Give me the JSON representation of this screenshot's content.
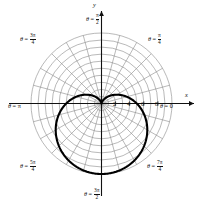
{
  "chart_data": {
    "type": "line",
    "plot_kind": "polar",
    "title": "",
    "xlabel": "x",
    "ylabel": "y",
    "curve_name": "cardioid",
    "curve_equation": "r = 5(1 - sin(theta))",
    "grid": true,
    "grid_circle_radii": [
      1,
      2,
      3,
      4,
      5,
      6,
      7,
      8,
      9,
      10
    ],
    "radial_line_step_degrees": 15,
    "rlim": [
      0,
      10
    ],
    "r_tick_values": [
      2,
      4,
      6,
      8
    ],
    "r_tick_labels": [
      "2",
      "4",
      "6",
      "8"
    ],
    "theta_labels": [
      {
        "id": "theta-0",
        "angle_deg": 0,
        "text": "θ = 0",
        "theta": "θ =",
        "value_kind": "plain",
        "value": "0"
      },
      {
        "id": "theta-pi-4",
        "angle_deg": 45,
        "text": "θ = π/4",
        "theta": "θ =",
        "value_kind": "frac",
        "num": "π",
        "den": "4"
      },
      {
        "id": "theta-pi-2",
        "angle_deg": 90,
        "text": "θ = π/2",
        "theta": "θ =",
        "value_kind": "frac",
        "num": "π",
        "den": "2"
      },
      {
        "id": "theta-3pi-4",
        "angle_deg": 135,
        "text": "θ = 3π/4",
        "theta": "θ =",
        "value_kind": "frac",
        "num": "3π",
        "den": "4"
      },
      {
        "id": "theta-pi",
        "angle_deg": 180,
        "text": "θ = π",
        "theta": "θ =",
        "value_kind": "plain",
        "value": "π"
      },
      {
        "id": "theta-5pi-4",
        "angle_deg": 225,
        "text": "θ = 5π/4",
        "theta": "θ =",
        "value_kind": "frac",
        "num": "5π",
        "den": "4"
      },
      {
        "id": "theta-3pi-2",
        "angle_deg": 270,
        "text": "θ = 3π/2",
        "theta": "θ =",
        "value_kind": "frac",
        "num": "3π",
        "den": "2"
      },
      {
        "id": "theta-7pi-4",
        "angle_deg": 315,
        "text": "θ = 7π/4",
        "theta": "θ =",
        "value_kind": "frac",
        "num": "7π",
        "den": "4"
      }
    ],
    "axis_labels": {
      "x": "x",
      "y": "y"
    },
    "series": [
      {
        "name": "cardioid",
        "color": "#000000",
        "points_r_theta": [
          [
            0.0,
            90
          ],
          [
            0.09,
            105
          ],
          [
            0.34,
            120
          ],
          [
            0.76,
            135
          ],
          [
            1.34,
            150
          ],
          [
            2.07,
            165
          ],
          [
            2.93,
            180
          ],
          [
            3.88,
            195
          ],
          [
            4.91,
            210
          ],
          [
            5.97,
            225
          ],
          [
            7.03,
            240
          ],
          [
            8.04,
            255
          ],
          [
            8.97,
            270
          ],
          [
            9.75,
            285
          ],
          [
            10.33,
            300
          ],
          [
            10.66,
            315
          ],
          [
            10.71,
            330
          ],
          [
            10.44,
            345
          ],
          [
            9.86,
            0
          ],
          [
            8.97,
            15
          ],
          [
            7.82,
            30
          ],
          [
            6.46,
            45
          ],
          [
            4.95,
            60
          ],
          [
            3.36,
            75
          ],
          [
            1.78,
            85
          ],
          [
            0.0,
            90
          ]
        ]
      }
    ]
  },
  "colors": {
    "grid": "#8a8a8a",
    "axis": "#111111",
    "curve": "#000000",
    "background": "#ffffff",
    "border": "#9a9a9a"
  }
}
